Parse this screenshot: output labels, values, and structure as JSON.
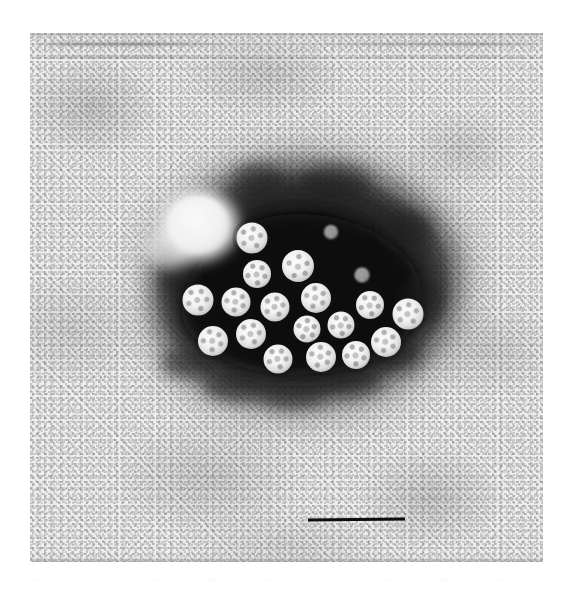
{
  "figure": {
    "panel_label": "(a)",
    "type": "transmission-electron-micrograph",
    "background_color": "#e9e9e9",
    "stain_color": "#141414",
    "particle_color": "#f6f6f6",
    "label_color": "#111111"
  },
  "plate": {
    "left": 30,
    "top": 33,
    "width": 513,
    "height": 529
  },
  "scale_bar": {
    "color": "#0d0d0d",
    "left": 278,
    "top": 485,
    "width": 97,
    "height": 3,
    "caption": ""
  },
  "panel_label_position": {
    "left": 37,
    "top": 533
  },
  "aggregate": {
    "particle_count": 19,
    "mean_particle_diameter_px": 30,
    "stain_hole": {
      "cx": 168,
      "cy": 192,
      "r": 33
    },
    "particles": [
      {
        "cx": 222,
        "cy": 205,
        "d": 31,
        "rot": 12
      },
      {
        "cx": 227,
        "cy": 241,
        "d": 28,
        "rot": 40
      },
      {
        "cx": 268,
        "cy": 233,
        "d": 32,
        "rot": 70
      },
      {
        "cx": 168,
        "cy": 267,
        "d": 31,
        "rot": 25
      },
      {
        "cx": 206,
        "cy": 269,
        "d": 29,
        "rot": 55
      },
      {
        "cx": 245,
        "cy": 274,
        "d": 29,
        "rot": 15
      },
      {
        "cx": 286,
        "cy": 265,
        "d": 30,
        "rot": 62
      },
      {
        "cx": 340,
        "cy": 272,
        "d": 28,
        "rot": 33
      },
      {
        "cx": 378,
        "cy": 281,
        "d": 31,
        "rot": 8
      },
      {
        "cx": 183,
        "cy": 308,
        "d": 30,
        "rot": 48
      },
      {
        "cx": 221,
        "cy": 301,
        "d": 30,
        "rot": 20
      },
      {
        "cx": 277,
        "cy": 296,
        "d": 27,
        "rot": 72
      },
      {
        "cx": 311,
        "cy": 292,
        "d": 27,
        "rot": 36
      },
      {
        "cx": 356,
        "cy": 309,
        "d": 30,
        "rot": 58
      },
      {
        "cx": 248,
        "cy": 326,
        "d": 29,
        "rot": 28
      },
      {
        "cx": 291,
        "cy": 324,
        "d": 30,
        "rot": 66
      },
      {
        "cx": 326,
        "cy": 322,
        "d": 28,
        "rot": 44
      },
      {
        "cx": 301,
        "cy": 199,
        "d": 14,
        "rot": 0
      },
      {
        "cx": 332,
        "cy": 242,
        "d": 15,
        "rot": 0
      }
    ]
  },
  "page_ghost": {
    "marks": [
      "",
      "",
      "",
      "",
      "",
      "",
      "",
      "",
      ""
    ]
  }
}
